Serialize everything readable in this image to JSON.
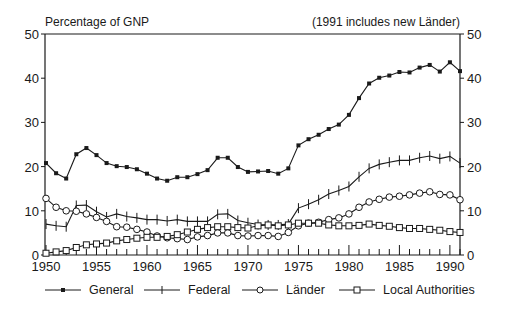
{
  "chart_data": {
    "type": "line",
    "title": "",
    "ylabel": "Percentage of GNP",
    "xlabel": "",
    "annotation": "(1991 includes new Länder)",
    "xlim": [
      1950,
      1991
    ],
    "ylim": [
      0,
      50
    ],
    "x_ticks": [
      1950,
      1955,
      1960,
      1965,
      1970,
      1975,
      1980,
      1985,
      1990
    ],
    "y_ticks": [
      0,
      10,
      20,
      30,
      40,
      50
    ],
    "grid": false,
    "legend_position": "bottom",
    "x": [
      1950,
      1951,
      1952,
      1953,
      1954,
      1955,
      1956,
      1957,
      1958,
      1959,
      1960,
      1961,
      1962,
      1963,
      1964,
      1965,
      1966,
      1967,
      1968,
      1969,
      1970,
      1971,
      1972,
      1973,
      1974,
      1975,
      1976,
      1977,
      1978,
      1979,
      1980,
      1981,
      1982,
      1983,
      1984,
      1985,
      1986,
      1987,
      1988,
      1989,
      1990,
      1991
    ],
    "series": [
      {
        "name": "General",
        "marker": "filled-square",
        "values": [
          20.8,
          18.5,
          17.3,
          22.8,
          24.2,
          22.6,
          20.8,
          20.1,
          19.9,
          19.4,
          18.4,
          17.3,
          16.8,
          17.6,
          17.6,
          18.3,
          19.2,
          22.0,
          22.0,
          19.9,
          18.8,
          18.9,
          19.0,
          18.4,
          19.6,
          24.8,
          26.2,
          27.2,
          28.5,
          29.5,
          31.7,
          35.5,
          38.8,
          40.1,
          40.6,
          41.4,
          41.3,
          42.4,
          43.0,
          41.5,
          43.6,
          41.6
        ]
      },
      {
        "name": "Federal",
        "marker": "plus",
        "values": [
          7.0,
          6.6,
          6.4,
          11.2,
          11.3,
          9.8,
          8.6,
          9.3,
          8.7,
          8.4,
          8.0,
          8.0,
          7.7,
          8.0,
          7.6,
          7.6,
          7.6,
          9.2,
          9.3,
          7.8,
          7.3,
          6.9,
          6.8,
          6.8,
          7.0,
          10.6,
          11.5,
          12.5,
          13.8,
          14.6,
          15.5,
          17.7,
          19.6,
          20.5,
          21.0,
          21.4,
          21.4,
          22.0,
          22.4,
          21.8,
          22.3,
          20.8
        ]
      },
      {
        "name": "Länder",
        "marker": "open-circle",
        "values": [
          12.8,
          10.8,
          10.0,
          9.9,
          9.3,
          8.5,
          7.6,
          6.4,
          6.3,
          5.8,
          5.2,
          4.3,
          3.9,
          3.7,
          3.5,
          4.1,
          4.4,
          5.0,
          5.0,
          4.4,
          4.3,
          4.4,
          4.4,
          4.2,
          5.1,
          6.6,
          7.2,
          7.4,
          8.0,
          8.4,
          9.3,
          10.8,
          12.0,
          12.6,
          13.1,
          13.3,
          13.6,
          14.0,
          14.3,
          13.7,
          13.6,
          12.5
        ]
      },
      {
        "name": "Local Authorities",
        "marker": "open-square",
        "values": [
          0.4,
          0.7,
          1.0,
          1.7,
          2.3,
          2.5,
          2.7,
          3.2,
          3.5,
          3.8,
          4.0,
          4.0,
          4.2,
          4.6,
          5.2,
          5.8,
          6.2,
          6.4,
          6.4,
          6.2,
          6.1,
          6.6,
          6.8,
          6.6,
          6.8,
          7.2,
          7.2,
          7.2,
          6.8,
          6.6,
          6.6,
          6.7,
          7.0,
          6.7,
          6.5,
          6.2,
          6.0,
          6.0,
          5.8,
          5.6,
          5.3,
          5.1
        ]
      }
    ]
  },
  "header": {
    "ylabel": "Percentage of GNP",
    "note": "(1991 includes new Länder)"
  },
  "legend": [
    {
      "label": "General",
      "icon": "line-filled-square"
    },
    {
      "label": "Federal",
      "icon": "line-plus"
    },
    {
      "label": "Länder",
      "icon": "line-open-circle"
    },
    {
      "label": "Local Authorities",
      "icon": "line-open-square"
    }
  ],
  "colors": {
    "line": "#1a1a1a",
    "background": "#ffffff"
  }
}
